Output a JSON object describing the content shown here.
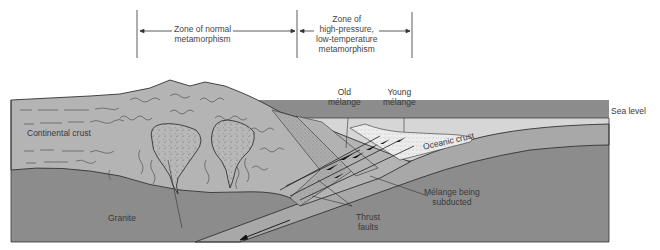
{
  "figure": {
    "zones": [
      {
        "label_line1": "Zone of normal",
        "label_line2": "metamorphism"
      },
      {
        "label_line1": "Zone of",
        "label_line2": "high-pressure,",
        "label_line3": "low-temperature",
        "label_line4": "metamorphism"
      }
    ],
    "labels": {
      "continental_crust": "Continental crust",
      "granite": "Granite",
      "old_melange_1": "Old",
      "old_melange_2": "mélange",
      "young_melange_1": "Young",
      "young_melange_2": "mélange",
      "sea_level": "Sea level",
      "oceanic_crust": "Oceanic crust",
      "melange_subducted_1": "Mélange being",
      "melange_subducted_2": "subducted",
      "thrust_faults_1": "Thrust",
      "thrust_faults_2": "faults"
    },
    "colors": {
      "continental": "#b4b4b4",
      "mantle": "#8c8c8c",
      "oceanic": "#a6a6a6",
      "sea": "#d9d9d9",
      "melange_young": "#ececec",
      "outline": "#333333"
    }
  }
}
